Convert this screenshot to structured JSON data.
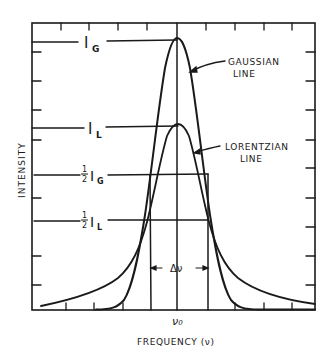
{
  "figure": {
    "ylabel": "INTENSITY",
    "xlabel": "FREQUENCY (ν)",
    "center_label": "ν₀",
    "curves": [
      {
        "name": "GAUSSIAN LINE",
        "label_line1": "GAUSSIAN",
        "label_line2": "LINE",
        "peak_label": "I",
        "peak_sub": "G"
      },
      {
        "name": "LORENTZIAN LINE",
        "label_line1": "LORENTZIAN",
        "label_line2": "LINE",
        "peak_label": "I",
        "peak_sub": "L"
      }
    ],
    "levels": [
      {
        "id": "IG",
        "frac": "",
        "main": "I",
        "sub": "G"
      },
      {
        "id": "IL",
        "frac": "",
        "main": "I",
        "sub": "L"
      },
      {
        "id": "halfIG",
        "frac_num": "1",
        "frac_den": "2",
        "main": "I",
        "sub": "G"
      },
      {
        "id": "halfIL",
        "frac_num": "1",
        "frac_den": "2",
        "main": "I",
        "sub": "L"
      }
    ],
    "width_label": "Δν",
    "colors": {
      "ink": "#1a1a1a",
      "background": "#ffffff"
    }
  }
}
